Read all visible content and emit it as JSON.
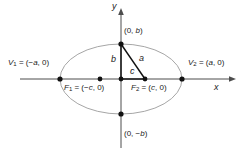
{
  "figure": {
    "width": 242,
    "height": 157,
    "background": "#ffffff"
  },
  "colors": {
    "ellipse_stroke": "#a6a6a6",
    "axis_stroke": "#4d4d4d",
    "triangle_stroke": "#111111",
    "point_fill": "#111111",
    "text": "#1a1a1a"
  },
  "axes": {
    "x_label": "x",
    "y_label": "y",
    "x_line": {
      "x1": 20,
      "y1": 79,
      "x2": 231,
      "y2": 79
    },
    "y_line": {
      "x1": 121,
      "y1": 9,
      "x2": 121,
      "y2": 148
    },
    "x_label_pos": {
      "x": 214,
      "y": 84
    },
    "y_label_pos": {
      "x": 113,
      "y": 2
    }
  },
  "ellipse": {
    "cx": 121,
    "cy": 79,
    "rx": 61,
    "ry": 35
  },
  "points": [
    {
      "name": "vertex-left",
      "x": 60,
      "y": 79,
      "r": 2.6
    },
    {
      "name": "vertex-right",
      "x": 182,
      "y": 79,
      "r": 2.6
    },
    {
      "name": "focus-left",
      "x": 100,
      "y": 79,
      "r": 2.4
    },
    {
      "name": "focus-right",
      "x": 145,
      "y": 79,
      "r": 2.4
    },
    {
      "name": "covertex-top",
      "x": 121,
      "y": 44,
      "r": 2.6
    },
    {
      "name": "covertex-bottom",
      "x": 121,
      "y": 114,
      "r": 2.6
    },
    {
      "name": "center",
      "x": 121,
      "y": 79,
      "r": 2.4
    }
  ],
  "triangle": {
    "leg_b": {
      "x1": 121,
      "y1": 44,
      "x2": 121,
      "y2": 79
    },
    "leg_c": {
      "x1": 121,
      "y1": 79,
      "x2": 145,
      "y2": 79
    },
    "hyp_a": {
      "x1": 121,
      "y1": 44,
      "x2": 145,
      "y2": 79
    }
  },
  "labels": {
    "vertex_left": {
      "text": "V₁ = (−a, 0)",
      "prefix": "V",
      "sub": "1",
      "eq": " = (−",
      "var": "a",
      "suffix": ", 0)",
      "x": 8,
      "y": 60
    },
    "vertex_right": {
      "text": "V₂ = (a, 0)",
      "prefix": "V",
      "sub": "2",
      "eq": " = (",
      "var": "a",
      "suffix": ", 0)",
      "x": 188,
      "y": 60
    },
    "focus_left": {
      "text": "F₁ = (−c, 0)",
      "prefix": "F",
      "sub": "1",
      "eq": " = (−",
      "var": "c",
      "suffix": ", 0)",
      "x": 64,
      "y": 84
    },
    "focus_right": {
      "text": "F₂ = (c, 0)",
      "prefix": "F",
      "sub": "2",
      "eq": " = (",
      "var": "c",
      "suffix": ", 0)",
      "x": 131,
      "y": 84
    },
    "covertex_top": {
      "text": "(0, b)",
      "pre": "(0, ",
      "var": "b",
      "post": ")",
      "x": 124,
      "y": 28
    },
    "covertex_bottom": {
      "text": "(0, −b)",
      "pre": "(0, −",
      "var": "b",
      "post": ")",
      "x": 124,
      "y": 130
    },
    "seg_a": {
      "text": "a",
      "x": 140,
      "y": 56
    },
    "seg_b": {
      "text": "b",
      "x": 112,
      "y": 57
    },
    "seg_c": {
      "text": "c",
      "x": 131,
      "y": 68
    }
  }
}
